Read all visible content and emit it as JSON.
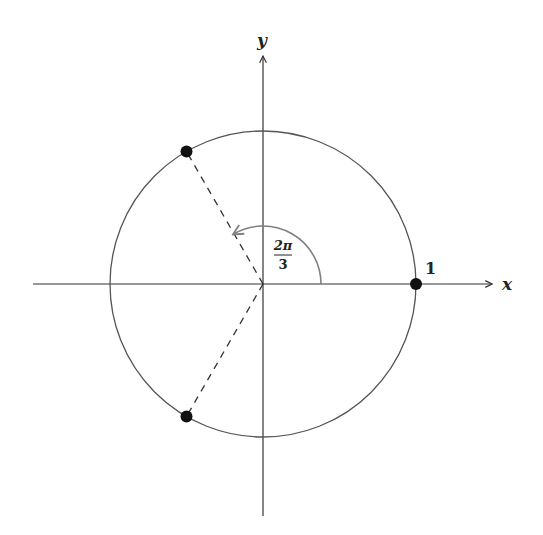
{
  "diagram": {
    "axes": {
      "x_label": "x",
      "y_label": "y"
    },
    "circle": {
      "center_px": [
        263,
        284
      ],
      "radius_px": 153,
      "stroke": "#555555"
    },
    "points": [
      {
        "name": "one",
        "angle_deg": 0,
        "label": "1"
      },
      {
        "name": "omega",
        "angle_deg": 120,
        "label": ""
      },
      {
        "name": "omega-squared",
        "angle_deg": 240,
        "label": ""
      }
    ],
    "angle_arc": {
      "label_numerator": "2π",
      "label_denominator": "3",
      "radius_px": 58,
      "from_deg": 0,
      "to_deg": 120,
      "color": "#808080"
    },
    "colors": {
      "axis": "#333333",
      "dashed": "#333333",
      "point": "#111111"
    }
  }
}
